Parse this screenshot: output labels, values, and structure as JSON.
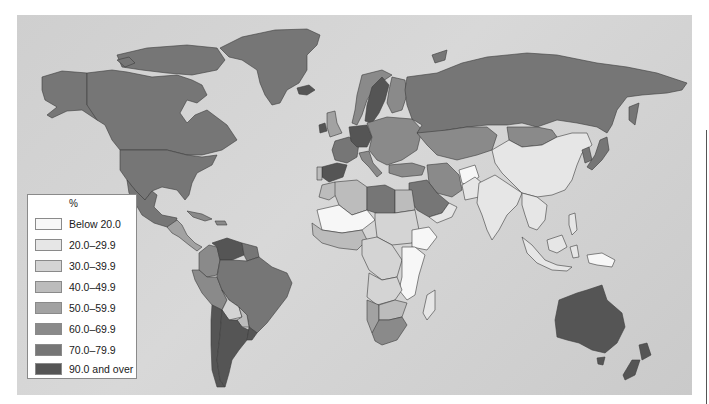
{
  "map": {
    "type": "choropleth world map",
    "background_color": "#d2d2d2",
    "border_color": "#3c3c3c"
  },
  "legend": {
    "title": "%",
    "items": [
      {
        "label": "Below 20.0",
        "color": "#f7f7f7"
      },
      {
        "label": "20.0–29.9",
        "color": "#e6e6e6"
      },
      {
        "label": "30.0–39.9",
        "color": "#d4d4d4"
      },
      {
        "label": "40.0–49.9",
        "color": "#bcbcbc"
      },
      {
        "label": "50.0–59.9",
        "color": "#a2a2a2"
      },
      {
        "label": "60.0–69.9",
        "color": "#8a8a8a"
      },
      {
        "label": "70.0–79.9",
        "color": "#767676"
      },
      {
        "label": "90.0 and over",
        "color": "#555555"
      }
    ]
  },
  "regions": [
    {
      "name": "Greenland",
      "class": 6
    },
    {
      "name": "Alaska / USA",
      "class": 6
    },
    {
      "name": "Canada",
      "class": 6
    },
    {
      "name": "Canadian Arctic Islands",
      "class": 6
    },
    {
      "name": "United States",
      "class": 6
    },
    {
      "name": "Mexico",
      "class": 6
    },
    {
      "name": "Central America",
      "class": 4
    },
    {
      "name": "Cuba / Caribbean",
      "class": 5
    },
    {
      "name": "Venezuela",
      "class": 7
    },
    {
      "name": "Colombia",
      "class": 5
    },
    {
      "name": "Guianas",
      "class": 6
    },
    {
      "name": "Ecuador / Peru",
      "class": 5
    },
    {
      "name": "Brazil",
      "class": 6
    },
    {
      "name": "Bolivia",
      "class": 2
    },
    {
      "name": "Paraguay",
      "class": 3
    },
    {
      "name": "Chile",
      "class": 7
    },
    {
      "name": "Argentina",
      "class": 7
    },
    {
      "name": "Uruguay",
      "class": 7
    },
    {
      "name": "Iceland",
      "class": 7
    },
    {
      "name": "United Kingdom",
      "class": 7
    },
    {
      "name": "Ireland",
      "class": 4
    },
    {
      "name": "Norway",
      "class": 5
    },
    {
      "name": "Sweden",
      "class": 7
    },
    {
      "name": "Finland",
      "class": 5
    },
    {
      "name": "France",
      "class": 6
    },
    {
      "name": "Spain",
      "class": 7
    },
    {
      "name": "Portugal",
      "class": 3
    },
    {
      "name": "Germany / Benelux",
      "class": 7
    },
    {
      "name": "Central & Eastern Europe",
      "class": 5
    },
    {
      "name": "Italy",
      "class": 5
    },
    {
      "name": "Russia",
      "class": 6
    },
    {
      "name": "Kazakhstan / Central Asia",
      "class": 5
    },
    {
      "name": "Mongolia",
      "class": 5
    },
    {
      "name": "China",
      "class": 1
    },
    {
      "name": "Korea",
      "class": 6
    },
    {
      "name": "Japan",
      "class": 6
    },
    {
      "name": "Turkey",
      "class": 5
    },
    {
      "name": "Iran",
      "class": 5
    },
    {
      "name": "Afghanistan",
      "class": 0
    },
    {
      "name": "Pakistan",
      "class": 1
    },
    {
      "name": "India",
      "class": 1
    },
    {
      "name": "Southeast Asia",
      "class": 1
    },
    {
      "name": "Indonesia / Philippines",
      "class": 1
    },
    {
      "name": "Papua New Guinea",
      "class": 0
    },
    {
      "name": "Saudi Arabia",
      "class": 6
    },
    {
      "name": "Yemen / Oman",
      "class": 1
    },
    {
      "name": "Morocco",
      "class": 3
    },
    {
      "name": "Algeria",
      "class": 3
    },
    {
      "name": "Libya",
      "class": 6
    },
    {
      "name": "Egypt",
      "class": 3
    },
    {
      "name": "Sahel (Mali, Niger)",
      "class": 0
    },
    {
      "name": "Sudan / Chad",
      "class": 2
    },
    {
      "name": "Ethiopia",
      "class": 0
    },
    {
      "name": "West Africa coast",
      "class": 3
    },
    {
      "name": "Central Africa",
      "class": 2
    },
    {
      "name": "East Africa",
      "class": 0
    },
    {
      "name": "Angola / Zambia",
      "class": 2
    },
    {
      "name": "Namibia",
      "class": 4
    },
    {
      "name": "Botswana / Zimbabwe",
      "class": 3
    },
    {
      "name": "South Africa",
      "class": 5
    },
    {
      "name": "Madagascar",
      "class": 1
    },
    {
      "name": "Australia",
      "class": 7
    },
    {
      "name": "New Zealand",
      "class": 7
    }
  ]
}
